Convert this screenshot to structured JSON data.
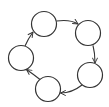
{
  "diagram": {
    "type": "directed-cycle",
    "node_count": 5,
    "nodes": [
      {
        "id": "n1",
        "label": "",
        "cx": 44,
        "cy": 24,
        "r": 12.5
      },
      {
        "id": "n2",
        "label": "",
        "cx": 88,
        "cy": 33,
        "r": 12.5
      },
      {
        "id": "n3",
        "label": "",
        "cx": 90,
        "cy": 75,
        "r": 12.5
      },
      {
        "id": "n4",
        "label": "",
        "cx": 48,
        "cy": 89,
        "r": 12.5
      },
      {
        "id": "n5",
        "label": "",
        "cx": 21,
        "cy": 58,
        "r": 12.5
      }
    ],
    "edges": [
      {
        "from": "n1",
        "to": "n2"
      },
      {
        "from": "n2",
        "to": "n3"
      },
      {
        "from": "n3",
        "to": "n4"
      },
      {
        "from": "n4",
        "to": "n5"
      },
      {
        "from": "n5",
        "to": "n1"
      }
    ],
    "colors": {
      "stroke": "#333333",
      "fill": "#ffffff",
      "background": "#ffffff"
    }
  }
}
